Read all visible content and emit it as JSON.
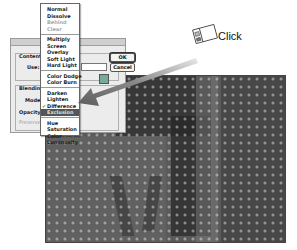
{
  "dialog": {
    "labels": {
      "contents": "Contents",
      "use": "Use:",
      "blending": "Blending",
      "mode": "Mode:",
      "opacity": "Opacity:",
      "preserve": "Preserve"
    },
    "use_value": "",
    "ok_label": "OK",
    "cancel_label": "Cancel"
  },
  "blend_menu": {
    "groups": [
      [
        {
          "label": "Normal",
          "enabled": true
        },
        {
          "label": "Dissolve",
          "enabled": true
        },
        {
          "label": "Behind",
          "enabled": false
        },
        {
          "label": "Clear",
          "enabled": false
        }
      ],
      [
        {
          "label": "Multiply",
          "enabled": true
        },
        {
          "label": "Screen",
          "enabled": true
        },
        {
          "label": "Overlay",
          "enabled": true
        },
        {
          "label": "Soft Light",
          "enabled": true
        },
        {
          "label": "Hard Light",
          "enabled": true
        }
      ],
      [
        {
          "label": "Color Dodge",
          "enabled": true
        },
        {
          "label": "Color Burn",
          "enabled": true
        }
      ],
      [
        {
          "label": "Darken",
          "enabled": true
        },
        {
          "label": "Lighten",
          "enabled": true
        },
        {
          "label": "Difference",
          "enabled": true,
          "checked": true
        },
        {
          "label": "Exclusion",
          "enabled": true,
          "highlighted": true
        }
      ],
      [
        {
          "label": "Hue",
          "enabled": true
        },
        {
          "label": "Saturation",
          "enabled": true
        },
        {
          "label": "Color",
          "enabled": true
        },
        {
          "label": "Luminosity",
          "enabled": true
        }
      ]
    ],
    "checkmark": "✓"
  },
  "callout": {
    "icon": "mouse-click-icon",
    "label": "Click"
  },
  "colors": {
    "highlight": "#555555",
    "arrow": "#6e6e6e"
  }
}
